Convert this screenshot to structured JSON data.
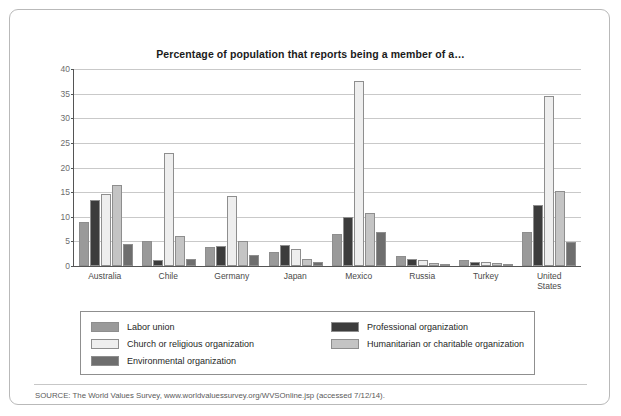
{
  "figure": {
    "title": "Percentage of population that reports being a member of a…",
    "source": "SOURCE: The World Values Survey, www.worldvaluessurvey.org/WVSOnline.jsp (accessed 7/12/14)."
  },
  "colors": {
    "labor_union": "#9a9a9a",
    "professional_organization": "#3c3c3c",
    "church_or_religious_organization": "#eeeeee",
    "humanitarian_or_charitable_organization": "#c4c4c4",
    "environmental_organization": "#6e6e6e",
    "gridline": "#c9c9c9",
    "axis": "#555555",
    "frame": "#b9b9b9"
  },
  "legend": {
    "position": "below-plot",
    "columns": [
      [
        {
          "label": "Labor union",
          "color_key": "labor_union"
        },
        {
          "label": "Church or religious organization",
          "color_key": "church_or_religious_organization"
        },
        {
          "label": "Environmental organization",
          "color_key": "environmental_organization"
        }
      ],
      [
        {
          "label": "Professional organization",
          "color_key": "professional_organization"
        },
        {
          "label": "Humanitarian or charitable organization",
          "color_key": "humanitarian_or_charitable_organization"
        }
      ]
    ]
  },
  "chart_data": {
    "type": "bar",
    "title": "Percentage of population that reports being a member of a…",
    "xlabel": "",
    "ylabel": "",
    "ylim": [
      0,
      40
    ],
    "yticks": [
      0,
      5,
      10,
      15,
      20,
      25,
      30,
      35,
      40
    ],
    "ytick_labels": [
      "0",
      "5",
      "10",
      "15",
      "20",
      "25",
      "30",
      "35",
      "40"
    ],
    "grid": true,
    "legend_position": "bottom",
    "categories": [
      "Australia",
      "Chile",
      "Germany",
      "Japan",
      "Mexico",
      "Russia",
      "Turkey",
      "United\nStates"
    ],
    "series": [
      {
        "name": "Labor union",
        "color_key": "labor_union",
        "values": [
          8.9,
          5.0,
          3.8,
          2.8,
          6.5,
          2.0,
          1.3,
          7.0
        ]
      },
      {
        "name": "Professional organization",
        "color_key": "professional_organization",
        "values": [
          13.5,
          1.2,
          4.0,
          4.2,
          10.0,
          1.5,
          0.9,
          12.3
        ]
      },
      {
        "name": "Church or religious organization",
        "color_key": "church_or_religious_organization",
        "values": [
          14.6,
          23.0,
          14.3,
          3.5,
          37.5,
          1.3,
          0.8,
          34.5
        ]
      },
      {
        "name": "Humanitarian or charitable organization",
        "color_key": "humanitarian_or_charitable_organization",
        "values": [
          16.5,
          6.0,
          5.0,
          1.5,
          10.8,
          0.6,
          0.7,
          15.3
        ]
      },
      {
        "name": "Environmental organization",
        "color_key": "environmental_organization",
        "values": [
          4.5,
          1.5,
          2.2,
          0.8,
          7.0,
          0.3,
          0.3,
          4.8
        ]
      }
    ]
  }
}
